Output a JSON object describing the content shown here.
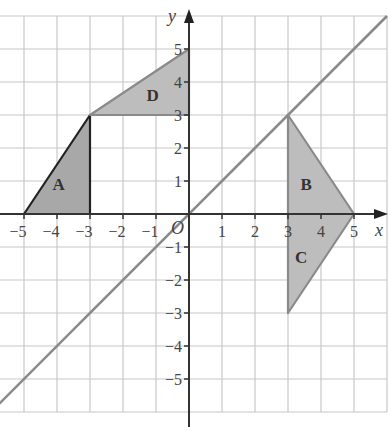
{
  "chart_data": {
    "type": "diagram",
    "title": "",
    "xlabel": "x",
    "ylabel": "y",
    "origin_label": "O",
    "xlim": [
      -5.7,
      6
    ],
    "ylim": [
      -6,
      6
    ],
    "grid": true,
    "x_ticks": [
      -5,
      -4,
      -3,
      -2,
      -1,
      1,
      2,
      3,
      4,
      5
    ],
    "y_ticks": [
      -5,
      -4,
      -3,
      -2,
      -1,
      1,
      2,
      3,
      4,
      5
    ],
    "x_tick_labels": [
      "−5",
      "−4",
      "−3",
      "−2",
      "−1",
      "1",
      "2",
      "3",
      "4",
      "5"
    ],
    "y_tick_labels": [
      "−5",
      "−4",
      "−3",
      "−2",
      "−1",
      "1",
      "2",
      "3",
      "4",
      "5"
    ],
    "line": {
      "equation": "y = x",
      "from": [
        -6,
        -6
      ],
      "to": [
        6,
        6
      ],
      "color": "#8a8a8a"
    },
    "shapes": [
      {
        "name": "A",
        "vertices": [
          [
            -5,
            0
          ],
          [
            -3,
            0
          ],
          [
            -3,
            3
          ]
        ],
        "label_at": [
          -3.95,
          0.9
        ],
        "fill": "#a8a8a8",
        "stroke": "#222222"
      },
      {
        "name": "D",
        "vertices": [
          [
            -3,
            3
          ],
          [
            0,
            3
          ],
          [
            0,
            5
          ]
        ],
        "label_at": [
          -1.1,
          3.6
        ],
        "fill": "#bdbdbd",
        "stroke": "#8a8a8a"
      },
      {
        "name": "B",
        "vertices": [
          [
            3,
            3
          ],
          [
            3,
            0
          ],
          [
            5,
            0
          ]
        ],
        "label_at": [
          3.55,
          0.9
        ],
        "fill": "#bdbdbd",
        "stroke": "#8a8a8a"
      },
      {
        "name": "C",
        "vertices": [
          [
            3,
            0
          ],
          [
            5,
            0
          ],
          [
            3,
            -3
          ]
        ],
        "label_at": [
          3.4,
          -1.3
        ],
        "fill": "#bdbdbd",
        "stroke": "#8a8a8a"
      }
    ]
  }
}
